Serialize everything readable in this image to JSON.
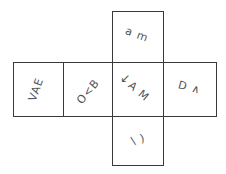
{
  "diagram": {
    "type": "cube-net",
    "faces": [
      {
        "id": "top",
        "glyphs": "a m",
        "rotation": 20
      },
      {
        "id": "left",
        "glyphs": "VAE",
        "rotation": -70
      },
      {
        "id": "center_left",
        "glyphs": "O<B",
        "rotation": -50
      },
      {
        "id": "center",
        "arrow": "↙",
        "glyphs": "A M",
        "rotation": 40
      },
      {
        "id": "right",
        "glyphs": "D ∧",
        "rotation": 15
      },
      {
        "id": "bottom",
        "glyphs": "\\ )",
        "rotation": -15
      }
    ],
    "line_color": "#3a3a3a",
    "glyph_color": "#555555"
  }
}
